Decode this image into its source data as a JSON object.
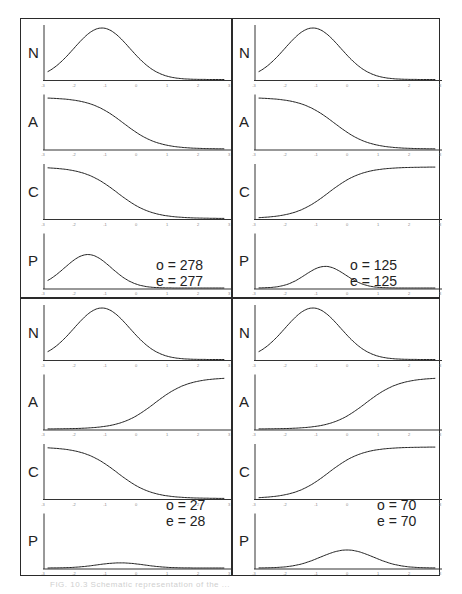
{
  "chart_data": [
    {
      "type": "line",
      "panel": "top-left",
      "x_range": [
        -3,
        3
      ],
      "xticks": [
        "-3",
        "-2",
        "-1",
        "0",
        "1",
        "2",
        "3"
      ],
      "subplots": [
        {
          "label": "N",
          "shape": "gaussian",
          "mu": -1.1,
          "sigma": 0.9,
          "amp": 1.0
        },
        {
          "label": "A",
          "shape": "logistic-decreasing",
          "center": -0.4,
          "scale": 0.55
        },
        {
          "label": "C",
          "shape": "logistic-decreasing",
          "center": -0.6,
          "scale": 0.55
        },
        {
          "label": "P",
          "shape": "gaussian",
          "mu": -1.55,
          "sigma": 0.75,
          "amp": 0.65
        }
      ],
      "annotation": {
        "o": "o = 278",
        "e": "e = 277"
      }
    },
    {
      "type": "line",
      "panel": "top-right",
      "x_range": [
        -3,
        3
      ],
      "xticks": [
        "-3",
        "-2",
        "-1",
        "0",
        "1",
        "2",
        "3"
      ],
      "subplots": [
        {
          "label": "N",
          "shape": "gaussian",
          "mu": -1.1,
          "sigma": 0.9,
          "amp": 1.0
        },
        {
          "label": "A",
          "shape": "logistic-decreasing",
          "center": -0.4,
          "scale": 0.55
        },
        {
          "label": "C",
          "shape": "logistic-increasing",
          "center": -0.6,
          "scale": 0.55
        },
        {
          "label": "P",
          "shape": "gaussian",
          "mu": -0.7,
          "sigma": 0.65,
          "amp": 0.42
        }
      ],
      "annotation": {
        "o": "o = 125",
        "e": "e = 125"
      }
    },
    {
      "type": "line",
      "panel": "bottom-left",
      "x_range": [
        -3,
        3
      ],
      "xticks": [
        "-3",
        "-2",
        "-1",
        "0",
        "1",
        "2",
        "3"
      ],
      "subplots": [
        {
          "label": "N",
          "shape": "gaussian",
          "mu": -1.1,
          "sigma": 0.9,
          "amp": 1.0
        },
        {
          "label": "A",
          "shape": "logistic-increasing",
          "center": 0.6,
          "scale": 0.55
        },
        {
          "label": "C",
          "shape": "logistic-decreasing",
          "center": -0.6,
          "scale": 0.55
        },
        {
          "label": "P",
          "shape": "gaussian",
          "mu": -0.5,
          "sigma": 0.75,
          "amp": 0.1
        }
      ],
      "annotation": {
        "o": "o = 27",
        "e": "e = 28"
      }
    },
    {
      "type": "line",
      "panel": "bottom-right",
      "x_range": [
        -3,
        3
      ],
      "xticks": [
        "-3",
        "-2",
        "-1",
        "0",
        "1",
        "2",
        "3"
      ],
      "subplots": [
        {
          "label": "N",
          "shape": "gaussian",
          "mu": -1.1,
          "sigma": 0.9,
          "amp": 1.0
        },
        {
          "label": "A",
          "shape": "logistic-increasing",
          "center": 0.6,
          "scale": 0.55
        },
        {
          "label": "C",
          "shape": "logistic-increasing",
          "center": -0.6,
          "scale": 0.55
        },
        {
          "label": "P",
          "shape": "gaussian",
          "mu": 0.0,
          "sigma": 0.85,
          "amp": 0.35
        }
      ],
      "annotation": {
        "o": "o = 70",
        "e": "e = 70"
      }
    }
  ],
  "caption": "FIG. 10.3 Schematic representation of the ..."
}
